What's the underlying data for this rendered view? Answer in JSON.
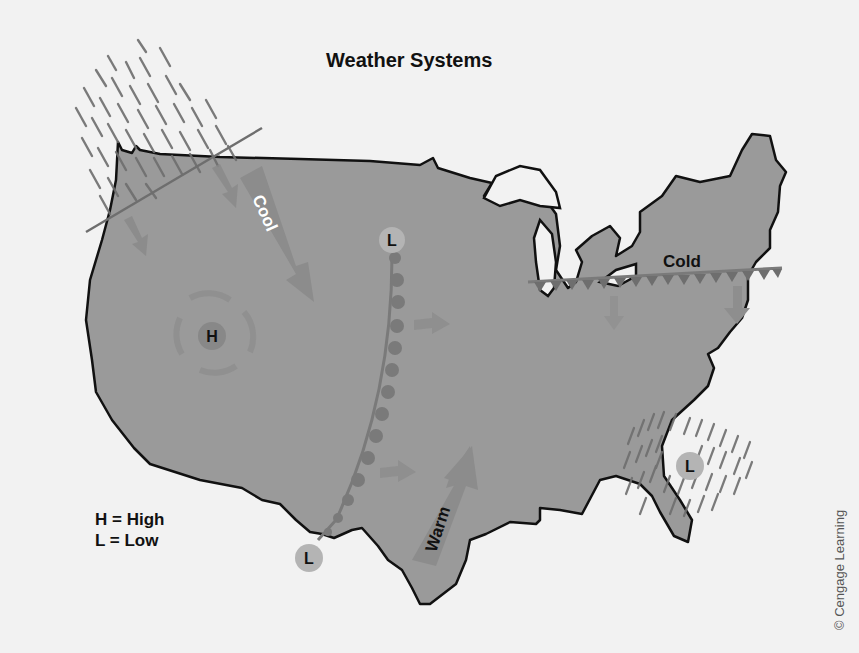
{
  "title": "Weather Systems",
  "legend": {
    "high": "H = High",
    "low": "L = Low"
  },
  "credit": "© Cengage Learning",
  "air_masses": {
    "cool": "Cool",
    "warm": "Warm"
  },
  "fronts": {
    "cold_label": "Cold"
  },
  "pressure_centers": {
    "high": "H",
    "low": "L"
  },
  "colors": {
    "background": "#f2f2f2",
    "land": "#9a9a9a",
    "outline": "#111111",
    "front": "#7a7a7a",
    "arrow": "#8a8a8a",
    "precip": "#6e6e6e",
    "low_circle": "#b4b4b4",
    "high_circle": "#888888"
  }
}
